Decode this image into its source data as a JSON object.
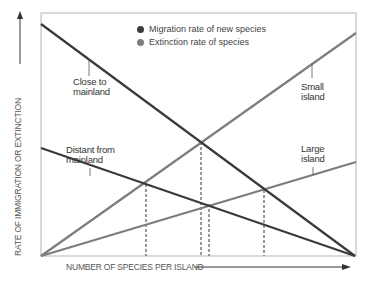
{
  "legend": {
    "items": [
      {
        "label": "Migration rate of new species",
        "color": "#3a3a3a",
        "icon": "dark-dot-icon"
      },
      {
        "label": "Extinction rate of species",
        "color": "#7d7d7d",
        "icon": "gray-dot-icon"
      }
    ]
  },
  "axes": {
    "y_label": "RATE OF IMMIGRATION OR EXTINCTION",
    "x_label": "NUMBER OF SPECIES PER ISLAND"
  },
  "labels": {
    "close_to_mainland": [
      "Close to",
      "mainland"
    ],
    "distant_from_mainland": [
      "Distant from",
      "mainland"
    ],
    "small_island": [
      "Small",
      "island"
    ],
    "large_island": [
      "Large",
      "island"
    ]
  },
  "colors": {
    "migration": "#3a3a3a",
    "extinction": "#7d7d7d",
    "frame": "#b5b5b5",
    "dashed": "#333333"
  },
  "diagram": {
    "type": "island-biogeography-equilibrium",
    "curves": [
      {
        "name": "Close to mainland",
        "kind": "migration",
        "from": [
          0,
          1.0
        ],
        "to": [
          1.0,
          0
        ]
      },
      {
        "name": "Distant from mainland",
        "kind": "migration",
        "from": [
          0,
          0.47
        ],
        "to": [
          1.0,
          0
        ]
      },
      {
        "name": "Small island",
        "kind": "extinction",
        "from": [
          0,
          0
        ],
        "to": [
          1.0,
          0.93
        ]
      },
      {
        "name": "Large island",
        "kind": "extinction",
        "from": [
          0,
          0
        ],
        "to": [
          1.0,
          0.39
        ]
      }
    ],
    "equilibrium_points": [
      {
        "pair": "Distant from mainland × Small island"
      },
      {
        "pair": "Close to mainland × Small island"
      },
      {
        "pair": "Distant from mainland × Large island"
      },
      {
        "pair": "Close to mainland × Large island"
      }
    ]
  }
}
